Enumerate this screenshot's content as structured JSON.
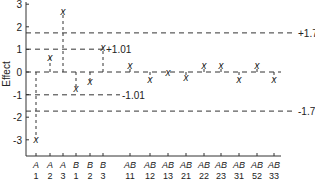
{
  "chart_data": {
    "type": "scatter",
    "title": "",
    "xlabel": "",
    "ylabel": "Effect",
    "ylim": [
      -3.5,
      3
    ],
    "yticks": [
      3,
      2,
      1,
      0,
      -1,
      -2,
      -3
    ],
    "categories": [
      {
        "top": "A",
        "bottom": "1"
      },
      {
        "top": "A",
        "bottom": "2"
      },
      {
        "top": "A",
        "bottom": "3"
      },
      {
        "top": "B",
        "bottom": "1"
      },
      {
        "top": "B",
        "bottom": "2"
      },
      {
        "top": "B",
        "bottom": "3"
      },
      {
        "top": "AB",
        "bottom": "11"
      },
      {
        "top": "AB",
        "bottom": "12"
      },
      {
        "top": "AB",
        "bottom": "13"
      },
      {
        "top": "AB",
        "bottom": "21"
      },
      {
        "top": "AB",
        "bottom": "22"
      },
      {
        "top": "AB",
        "bottom": "23"
      },
      {
        "top": "AB",
        "bottom": "31"
      },
      {
        "top": "AB",
        "bottom": "52"
      },
      {
        "top": "AB",
        "bottom": "33"
      }
    ],
    "values": [
      -2.95,
      0.65,
      2.7,
      -0.7,
      -0.4,
      1.1,
      0.3,
      -0.3,
      0.0,
      -0.2,
      0.3,
      0.3,
      -0.3,
      0.3,
      -0.3
    ],
    "reference_lines": [
      {
        "value": 1.73,
        "label": "+1.73",
        "extent": "full"
      },
      {
        "value": 1.01,
        "label": "+1.01",
        "extent": "partial"
      },
      {
        "value": -1.01,
        "label": "-1.01",
        "extent": "partial"
      },
      {
        "value": -1.73,
        "label": "-1.73",
        "extent": "full"
      }
    ],
    "marker": "X",
    "grid": false,
    "legend": "none"
  }
}
